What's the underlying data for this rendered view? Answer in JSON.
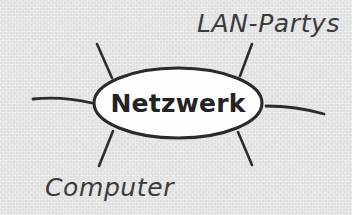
{
  "diagram": {
    "type": "mind-map",
    "language": "de",
    "canvas": {
      "width": 352,
      "height": 215
    },
    "colors": {
      "background": "#e3e3e3",
      "stroke": "#2c2c2c",
      "node_fill": "#fdfdfd",
      "node_stroke": "#2a2a2a",
      "center_text": "#232323",
      "branch_text": "#3b3b3b"
    },
    "center_node": {
      "label": "Netzwerk",
      "shape": "ellipse",
      "cx": 178,
      "cy": 103,
      "rx": 84,
      "ry": 35
    },
    "branches": [
      {
        "id": "upper-left",
        "label": "",
        "has_label": false
      },
      {
        "id": "upper-right",
        "label": "LAN-Partys",
        "has_label": true
      },
      {
        "id": "left",
        "label": "",
        "has_label": false
      },
      {
        "id": "right",
        "label": "",
        "has_label": false
      },
      {
        "id": "lower-left",
        "label": "Computer",
        "has_label": true
      },
      {
        "id": "lower-right",
        "label": "",
        "has_label": false
      }
    ],
    "labels": {
      "lan_partys": "LAN-Partys",
      "computer": "Computer"
    }
  }
}
